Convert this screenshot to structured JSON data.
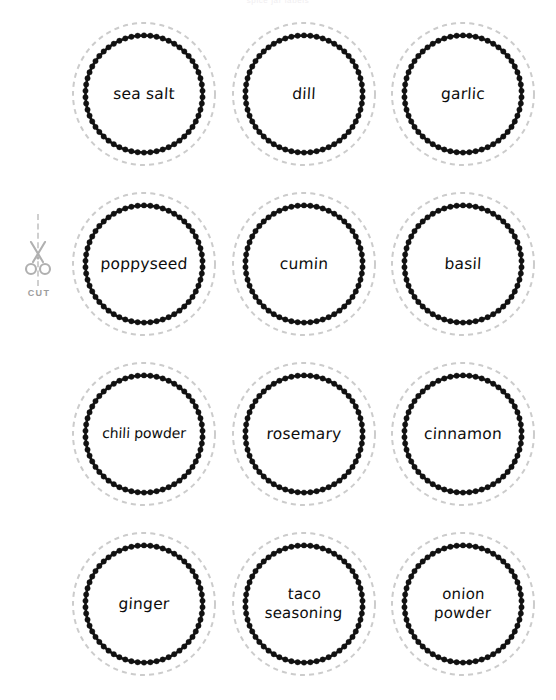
{
  "page": {
    "header_text": "spice jar labels",
    "background_color": "#ffffff",
    "ink_color": "#111111",
    "guide_color": "#cccccc"
  },
  "cut_guide": {
    "icon": "scissors-icon",
    "label": "CUT",
    "color": "#9d9d9d"
  },
  "labels": [
    {
      "id": "sea-salt",
      "text": "sea salt",
      "row": 1,
      "col": 1,
      "lines": 1
    },
    {
      "id": "dill",
      "text": "dill",
      "row": 1,
      "col": 2,
      "lines": 1
    },
    {
      "id": "garlic",
      "text": "garlic",
      "row": 1,
      "col": 3,
      "lines": 1
    },
    {
      "id": "poppyseed",
      "text": "poppyseed",
      "row": 2,
      "col": 1,
      "lines": 1
    },
    {
      "id": "cumin",
      "text": "cumin",
      "row": 2,
      "col": 2,
      "lines": 1
    },
    {
      "id": "basil",
      "text": "basil",
      "row": 2,
      "col": 3,
      "lines": 1
    },
    {
      "id": "chili-powder",
      "text": "chili powder",
      "row": 3,
      "col": 1,
      "lines": 1
    },
    {
      "id": "rosemary",
      "text": "rosemary",
      "row": 3,
      "col": 2,
      "lines": 1
    },
    {
      "id": "cinnamon",
      "text": "cinnamon",
      "row": 3,
      "col": 3,
      "lines": 1
    },
    {
      "id": "ginger",
      "text": "ginger",
      "row": 4,
      "col": 1,
      "lines": 1
    },
    {
      "id": "taco-seasoning",
      "text": "taco\nseasoning",
      "row": 4,
      "col": 2,
      "lines": 2
    },
    {
      "id": "onion-powder",
      "text": "onion\npowder",
      "row": 4,
      "col": 3,
      "lines": 2
    }
  ]
}
